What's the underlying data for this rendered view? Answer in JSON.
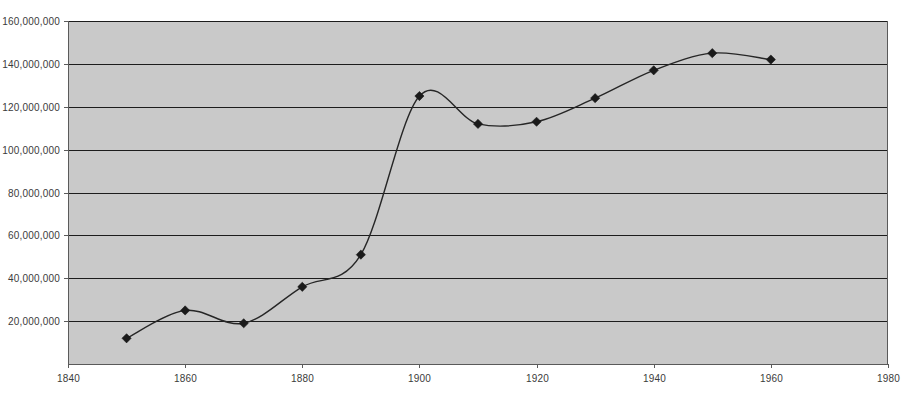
{
  "chart_data": {
    "type": "line",
    "title": "",
    "subtitle": "",
    "xlabel": "",
    "ylabel": "",
    "grid": "horizontal",
    "legend": "none",
    "xlim": [
      1840,
      1980
    ],
    "ylim": [
      0,
      160000000
    ],
    "x_tick_labels": [
      "1840",
      "1860",
      "1880",
      "1900",
      "1920",
      "1940",
      "1960",
      "1980"
    ],
    "x_ticks": [
      1840,
      1860,
      1880,
      1900,
      1920,
      1940,
      1960,
      1980
    ],
    "y_tick_labels": [
      "160,000,000",
      "140,000,000",
      "120,000,000",
      "100,000,000",
      "80,000,000",
      "60,000,000",
      "40,000,000",
      "20,000,000"
    ],
    "y_ticks": [
      160000000,
      140000000,
      120000000,
      100000000,
      80000000,
      60000000,
      40000000,
      20000000
    ],
    "marker": "diamond",
    "smoothed": true,
    "series": [
      {
        "name": "",
        "color": "#262626",
        "x": [
          1850,
          1860,
          1870,
          1880,
          1890,
          1900,
          1910,
          1920,
          1930,
          1940,
          1950,
          1960
        ],
        "values": [
          12000000,
          25000000,
          19000000,
          36000000,
          51000000,
          125000000,
          112000000,
          113000000,
          124000000,
          137000000,
          145000000,
          142000000
        ]
      }
    ]
  },
  "style": {
    "plot_background": "#c9c9c9",
    "gridline_color": "#1c1c1c",
    "axis_color": "#5a5a5a",
    "line_color": "#262626",
    "marker_color": "#1a1a1a",
    "page_background": "#ffffff",
    "tick_label_color": "#3b3b3b"
  }
}
